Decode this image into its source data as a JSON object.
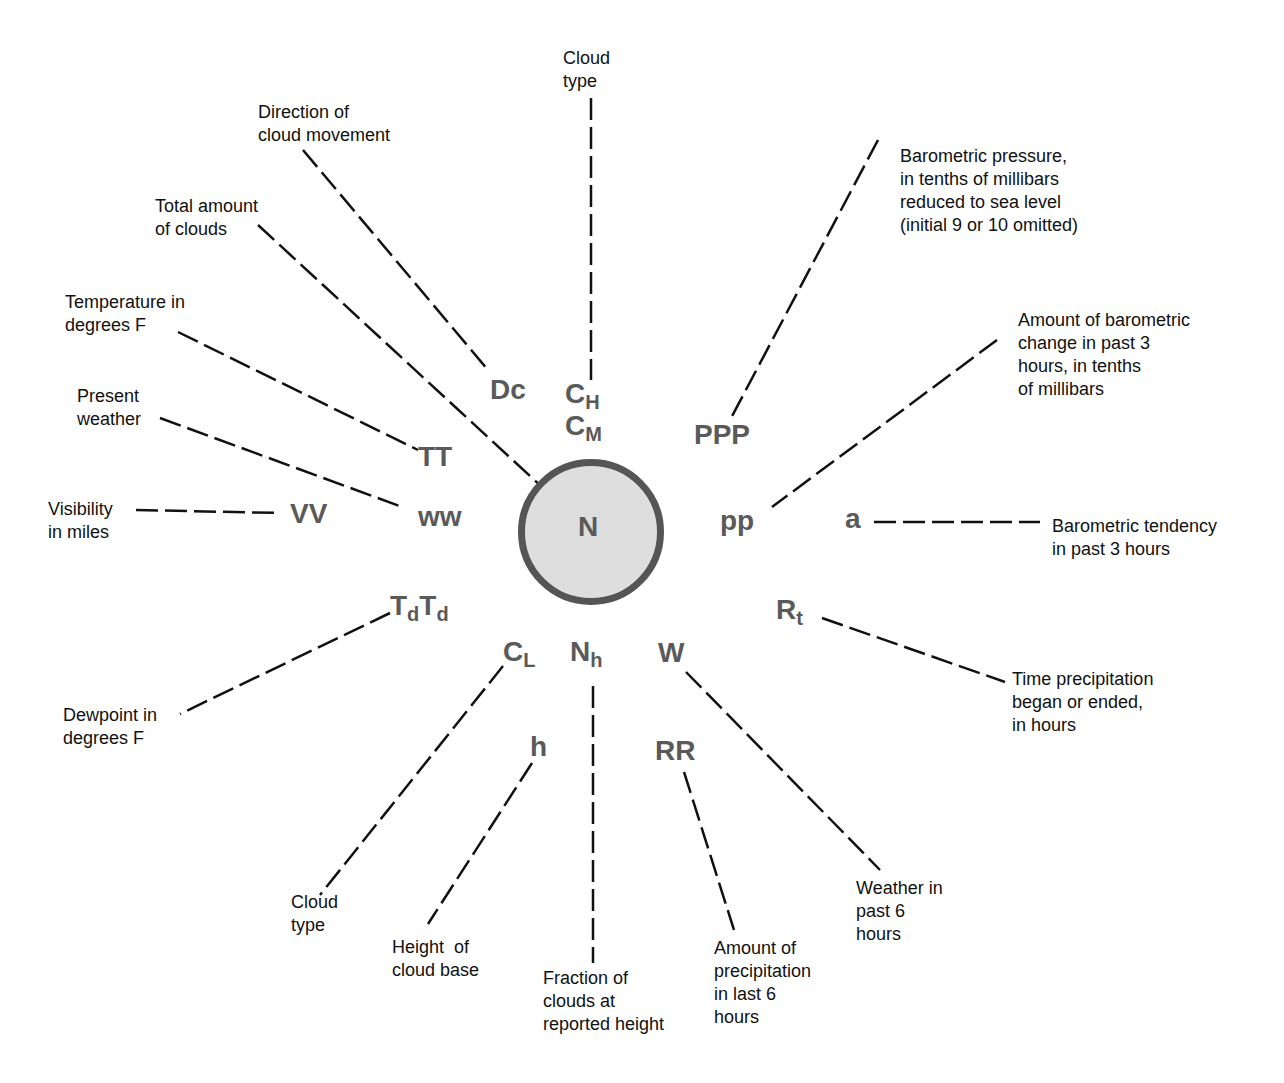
{
  "station_model": {
    "center": {
      "symbol": "N",
      "description": "Total amount of clouds"
    },
    "symbols": {
      "Dc": "Dc",
      "CH": {
        "base": "C",
        "sub": "H"
      },
      "CM": {
        "base": "C",
        "sub": "M"
      },
      "PPP": "PPP",
      "TT": "TT",
      "ww": "ww",
      "VV": "VV",
      "pp": "pp",
      "a": "a",
      "TdTd": {
        "base1": "T",
        "sub1": "d",
        "base2": "T",
        "sub2": "d"
      },
      "Rt": {
        "base": "R",
        "sub": "t"
      },
      "CL": {
        "base": "C",
        "sub": "L"
      },
      "Nh": {
        "base": "N",
        "sub": "h"
      },
      "W": "W",
      "h": "h",
      "RR": "RR"
    },
    "labels": {
      "cloud_type_top": "Cloud\ntype",
      "direction_cloud": "Direction of\ncloud movement",
      "total_clouds": "Total amount\nof clouds",
      "temperature": "Temperature in\ndegrees F",
      "present_weather": "Present\nweather",
      "visibility": "Visibility\nin miles",
      "barometric_pressure": "Barometric pressure,\nin tenths of millibars\nreduced to sea level\n(initial 9 or 10 omitted)",
      "barometric_change": "Amount of barometric\nchange in past 3\nhours, in tenths\nof millibars",
      "barometric_tendency": "Barometric tendency\nin past 3 hours",
      "time_precip": "Time precipitation\nbegan or ended,\nin hours",
      "dewpoint": "Dewpoint in\ndegrees F",
      "cloud_type_low": "Cloud\ntype",
      "height_cloud_base": "Height  of\ncloud base",
      "fraction_clouds": "Fraction of\nclouds at\nreported height",
      "precip_amount": "Amount of\nprecipitation\nin last 6\nhours",
      "weather_past": "Weather in\npast 6\nhours"
    },
    "colors": {
      "symbol": "#5a5a5a",
      "circle_fill": "#dedede",
      "circle_stroke": "#555555",
      "line": "#111111"
    }
  }
}
